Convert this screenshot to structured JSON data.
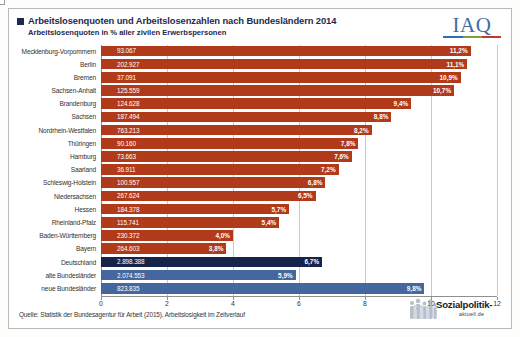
{
  "header": {
    "title": "Arbeitslosenquoten und Arbeitslosenzahlen nach Bundesländern 2014",
    "subtitle": "Arbeitslosenquoten in % aller zivilen Erwerbspersonen",
    "logo_text": "IAQ"
  },
  "footer": {
    "source": "Quelle: Statistik der Bundesagentur für Arbeit (2015), Arbeitslosigkeit im Zeitverlauf",
    "brand_name": "Sozialpolitik-",
    "brand_tld": "aktuell.de"
  },
  "chart_data": {
    "type": "bar",
    "orientation": "horizontal",
    "title": "Arbeitslosenquoten und Arbeitslosenzahlen nach Bundesländern 2014",
    "subtitle": "Arbeitslosenquoten in % aller zivilen Erwerbspersonen",
    "xlabel": "",
    "ylabel": "",
    "xlim": [
      0,
      12
    ],
    "xticks": [
      0,
      2,
      4,
      6,
      8,
      10,
      12
    ],
    "xtick_labels": [
      "0",
      "2",
      "4",
      "6",
      "8",
      "10",
      "12"
    ],
    "grid": true,
    "legend": null,
    "value_unit": "%",
    "count_label": "Arbeitslosenzahlen",
    "colors": {
      "state": "#b03a1a",
      "germany": "#16234a",
      "region": "#43679e"
    },
    "categories": [
      "Mecklenburg-Vorpommern",
      "Berlin",
      "Bremen",
      "Sachsen-Anhalt",
      "Brandenburg",
      "Sachsen",
      "Nordrhein-Westfalen",
      "Thüringen",
      "Hamburg",
      "Saarland",
      "Schleswig-Holstein",
      "Niedersachsen",
      "Hessen",
      "Rheinland-Pfalz",
      "Baden-Württemberg",
      "Bayern",
      "Deutschland",
      "alte Bundesländer",
      "neue Bundesländer"
    ],
    "values": [
      11.2,
      11.1,
      10.9,
      10.7,
      9.4,
      8.8,
      8.2,
      7.8,
      7.6,
      7.2,
      6.8,
      6.5,
      5.7,
      5.4,
      4.0,
      3.8,
      6.7,
      5.9,
      9.8
    ],
    "counts": [
      "93.067",
      "202.927",
      "37.091",
      "125.559",
      "124.628",
      "187.494",
      "763.213",
      "90.160",
      "73.663",
      "36.911",
      "100.957",
      "267.624",
      "184.378",
      "115.741",
      "230.372",
      "264.603",
      "2.898.388",
      "2.074.553",
      "823.835"
    ],
    "rows": [
      {
        "label": "Mecklenburg-Vorpommern",
        "count": "93.067",
        "pct": 11.2,
        "pct_label": "11,2%",
        "group": "state"
      },
      {
        "label": "Berlin",
        "count": "202.927",
        "pct": 11.1,
        "pct_label": "11,1%",
        "group": "state"
      },
      {
        "label": "Bremen",
        "count": "37.091",
        "pct": 10.9,
        "pct_label": "10,9%",
        "group": "state"
      },
      {
        "label": "Sachsen-Anhalt",
        "count": "125.559",
        "pct": 10.7,
        "pct_label": "10,7%",
        "group": "state"
      },
      {
        "label": "Brandenburg",
        "count": "124.628",
        "pct": 9.4,
        "pct_label": "9,4%",
        "group": "state"
      },
      {
        "label": "Sachsen",
        "count": "187.494",
        "pct": 8.8,
        "pct_label": "8,8%",
        "group": "state"
      },
      {
        "label": "Nordrhein-Westfalen",
        "count": "763.213",
        "pct": 8.2,
        "pct_label": "8,2%",
        "group": "state"
      },
      {
        "label": "Thüringen",
        "count": "90.160",
        "pct": 7.8,
        "pct_label": "7,8%",
        "group": "state"
      },
      {
        "label": "Hamburg",
        "count": "73.663",
        "pct": 7.6,
        "pct_label": "7,6%",
        "group": "state"
      },
      {
        "label": "Saarland",
        "count": "36.911",
        "pct": 7.2,
        "pct_label": "7,2%",
        "group": "state"
      },
      {
        "label": "Schleswig-Holstein",
        "count": "100.957",
        "pct": 6.8,
        "pct_label": "6,8%",
        "group": "state"
      },
      {
        "label": "Niedersachsen",
        "count": "267.624",
        "pct": 6.5,
        "pct_label": "6,5%",
        "group": "state"
      },
      {
        "label": "Hessen",
        "count": "184.378",
        "pct": 5.7,
        "pct_label": "5,7%",
        "group": "state"
      },
      {
        "label": "Rheinland-Pfalz",
        "count": "115.741",
        "pct": 5.4,
        "pct_label": "5,4%",
        "group": "state"
      },
      {
        "label": "Baden-Württemberg",
        "count": "230.372",
        "pct": 4.0,
        "pct_label": "4,0%",
        "group": "state"
      },
      {
        "label": "Bayern",
        "count": "264.603",
        "pct": 3.8,
        "pct_label": "3,8%",
        "group": "state"
      },
      {
        "label": "Deutschland",
        "count": "2.898.388",
        "pct": 6.7,
        "pct_label": "6,7%",
        "group": "germany"
      },
      {
        "label": "alte Bundesländer",
        "count": "2.074.553",
        "pct": 5.9,
        "pct_label": "5,9%",
        "group": "region"
      },
      {
        "label": "neue Bundesländer",
        "count": "823.835",
        "pct": 9.8,
        "pct_label": "9,8%",
        "group": "region"
      }
    ]
  }
}
